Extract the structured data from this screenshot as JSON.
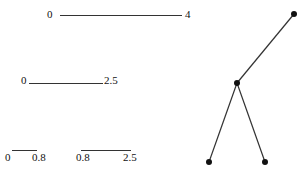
{
  "diagram": {
    "intervals": [
      {
        "start": "0",
        "end": "4"
      },
      {
        "start": "0",
        "end": "2.5"
      },
      {
        "start": "0",
        "end": "0.8"
      },
      {
        "start": "0.8",
        "end": "2.5"
      }
    ],
    "tree": {
      "nodes": [
        "root",
        "internal",
        "leaf-left",
        "leaf-right"
      ],
      "edges": [
        [
          "root",
          "internal"
        ],
        [
          "internal",
          "leaf-left"
        ],
        [
          "internal",
          "leaf-right"
        ]
      ]
    }
  }
}
